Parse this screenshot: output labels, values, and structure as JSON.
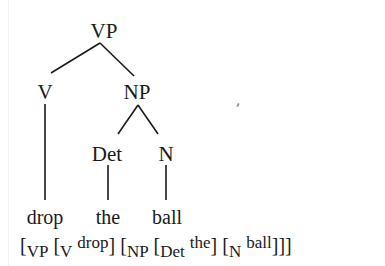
{
  "tree": {
    "root": "VP",
    "level1": {
      "left": "V",
      "right": "NP"
    },
    "level2": {
      "det": "Det",
      "n": "N"
    },
    "leaves": {
      "verb": "drop",
      "det": "the",
      "noun": "ball"
    },
    "edges": [
      [
        "VP",
        "V"
      ],
      [
        "VP",
        "NP"
      ],
      [
        "V",
        "drop"
      ],
      [
        "NP",
        "Det"
      ],
      [
        "NP",
        "N"
      ],
      [
        "Det",
        "the"
      ],
      [
        "N",
        "ball"
      ]
    ]
  },
  "bracketed": {
    "parts": [
      {
        "bracket": "[",
        "label": "VP"
      },
      {
        "bracket": "[",
        "label": "V",
        "word": "drop",
        "close": "]"
      },
      {
        "bracket": "[",
        "label": "NP"
      },
      {
        "bracket": "[",
        "label": "Det",
        "word": "the",
        "close": "]"
      },
      {
        "bracket": "[",
        "label": "N",
        "word": "ball",
        "close": "]]]"
      }
    ]
  }
}
